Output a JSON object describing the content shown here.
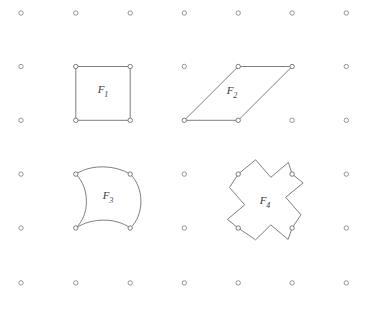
{
  "figure": {
    "background_color": "#ffffff",
    "stroke_color": "#707070",
    "dot_stroke_color": "#8a8a8a",
    "label_color": "#3b3b3b",
    "grid": {
      "columns_x": [
        21,
        75.8,
        130.2,
        184.3,
        238.2,
        292.1,
        346.3
      ],
      "rows_y": [
        13,
        66.5,
        120.3,
        174.1,
        228.0,
        282.9
      ],
      "dot_radius": 2.2,
      "dot_style": "open-circle"
    },
    "shapes": [
      {
        "id": "F1",
        "label": "F",
        "subscript": "1",
        "kind": "square",
        "label_x": 103,
        "label_y": 90,
        "vertices": [
          [
            75.8,
            66.5
          ],
          [
            130.2,
            66.5
          ],
          [
            130.2,
            120.3
          ],
          [
            75.8,
            120.3
          ]
        ],
        "path": "M 75.8 66.5 L 130.2 66.5 L 130.2 120.3 L 75.8 120.3 Z"
      },
      {
        "id": "F2",
        "label": "F",
        "subscript": "2",
        "kind": "parallelogram",
        "label_x": 232,
        "label_y": 91,
        "vertices": [
          [
            238.2,
            66.5
          ],
          [
            292.1,
            66.5
          ],
          [
            238.2,
            120.3
          ],
          [
            184.3,
            120.3
          ]
        ],
        "path": "M 238.2 66.5 L 292.1 66.5 L 238.2 120.3 L 184.3 120.3 Z"
      },
      {
        "id": "F3",
        "label": "F",
        "subscript": "3",
        "kind": "curved-quadrilateral",
        "label_x": 108,
        "label_y": 196,
        "vertices": [
          [
            75.8,
            174.1
          ],
          [
            130.2,
            174.1
          ],
          [
            130.2,
            228.0
          ],
          [
            75.8,
            228.0
          ]
        ],
        "path": "M 75.8 174.1 C 92 163.5 116 165.5 130.2 174.1 C 144.5 188 144.5 215 130.2 228.0 C 116 217.5 92 217.5 75.8 228.0 C 90 215 90 188 75.8 174.1 Z"
      },
      {
        "id": "F4",
        "label": "F",
        "subscript": "4",
        "kind": "rotated-cross",
        "label_x": 265,
        "label_y": 201,
        "vertices": [
          [
            238.2,
            174.1
          ],
          [
            292.1,
            174.1
          ],
          [
            292.1,
            228.0
          ],
          [
            238.2,
            228.0
          ]
        ],
        "path": "M 238.2 174.1 L 255.6 159.8 L 270.8 177.3 L 288.4 162.5 L 292.1 174.1 L 303.1 182.9 L 285.7 197.3 L 300.9 214.8 L 292.1 228.0 L 288.1 239.5 L 270.8 224.9 L 255.6 239.8 L 238.2 228.0 L 227.4 219.4 L 244.7 204.9 L 229.5 187.4 Z"
      }
    ]
  }
}
